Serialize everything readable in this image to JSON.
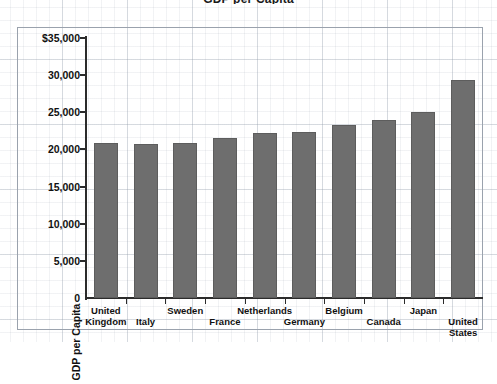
{
  "chart_data": {
    "type": "bar",
    "title": "GDP per Capita",
    "xlabel": "",
    "ylabel": "GDP per Capita",
    "ylim": [
      0,
      35000
    ],
    "ytick_values": [
      0,
      5000,
      10000,
      15000,
      20000,
      25000,
      30000,
      35000
    ],
    "ytick_labels": [
      "0",
      "5,000",
      "10,000",
      "15,000",
      "20,000",
      "25,000",
      "30,000",
      "$35,000"
    ],
    "grid": true,
    "legend": false,
    "bar_color": "#6e6e6e",
    "categories": [
      "United Kingdom",
      "Italy",
      "Sweden",
      "France",
      "Netherlands",
      "Germany",
      "Belgium",
      "Canada",
      "Japan",
      "United States"
    ],
    "category_lines": [
      [
        "United",
        "Kingdom"
      ],
      [
        "Italy",
        ""
      ],
      [
        "Sweden",
        ""
      ],
      [
        "France",
        ""
      ],
      [
        "Netherlands",
        ""
      ],
      [
        "Germany",
        ""
      ],
      [
        "Belgium",
        ""
      ],
      [
        "Canada",
        ""
      ],
      [
        "Japan",
        ""
      ],
      [
        "United",
        "States"
      ]
    ],
    "values": [
      20900,
      20700,
      20900,
      21500,
      22200,
      22300,
      23300,
      23900,
      25000,
      29400
    ]
  },
  "axes": {
    "y_axis_title": "GDP per Capita"
  }
}
